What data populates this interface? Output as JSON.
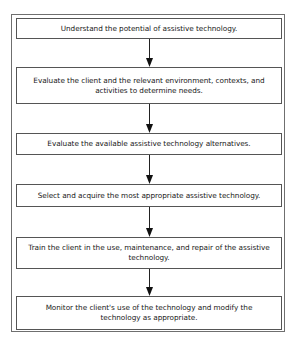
{
  "diagram": {
    "type": "flowchart",
    "direction": "top-to-bottom",
    "steps": [
      {
        "id": "s1",
        "label": "Understand the potential of assistive technology."
      },
      {
        "id": "s2",
        "label": "Evaluate the client and the relevant environment, contexts, and activities to determine needs."
      },
      {
        "id": "s3",
        "label": "Evaluate the available assistive technology alternatives."
      },
      {
        "id": "s4",
        "label": "Select and acquire the most appropriate assistive technology."
      },
      {
        "id": "s5",
        "label": "Train the client in the use, maintenance, and repair of the assistive technology."
      },
      {
        "id": "s6",
        "label": "Monitor the client's use of the technology and modify the technology as appropriate."
      }
    ],
    "edges": [
      {
        "from": "s1",
        "to": "s2"
      },
      {
        "from": "s2",
        "to": "s3"
      },
      {
        "from": "s3",
        "to": "s4"
      },
      {
        "from": "s4",
        "to": "s5"
      },
      {
        "from": "s5",
        "to": "s6"
      }
    ],
    "colors": {
      "border": "#555555",
      "text": "#1a1a1a",
      "background": "#ffffff"
    }
  }
}
